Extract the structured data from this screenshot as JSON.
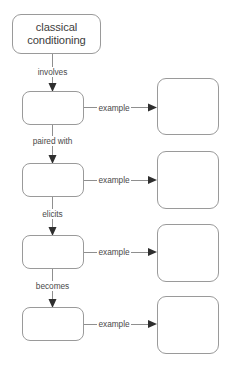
{
  "diagram": {
    "type": "concept-map",
    "title_node": {
      "label": "classical\nconditioning"
    },
    "chain_nodes": [
      {
        "label": ""
      },
      {
        "label": ""
      },
      {
        "label": ""
      },
      {
        "label": ""
      }
    ],
    "chain_connector_labels": [
      "involves",
      "paired with",
      "elicits",
      "becomes"
    ],
    "example_nodes": [
      {
        "label": ""
      },
      {
        "label": ""
      },
      {
        "label": ""
      },
      {
        "label": ""
      }
    ],
    "example_connector_labels": [
      "example",
      "example",
      "example",
      "example"
    ],
    "colors": {
      "background": "#ffffff",
      "node_border": "#9a9a9a",
      "node_fill": "#ffffff",
      "connector_line": "#8f8f8f",
      "arrow_head": "#2f2f2f",
      "title_text": "#3d3d3d",
      "label_text": "#4a4a4a"
    }
  }
}
